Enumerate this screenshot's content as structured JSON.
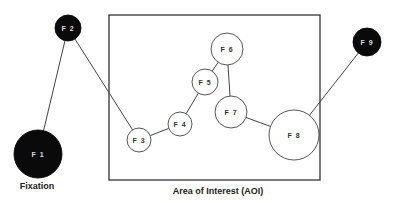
{
  "diagram": {
    "aoi_label": "Area of Interest (AOI)",
    "fixation_label": "Fixation",
    "colors": {
      "filled": "#0a0a0a",
      "outline": "#444444",
      "text_light": "#dddddd",
      "text_dark": "#333333"
    },
    "fixations": [
      {
        "id": "F1",
        "label": "F 1",
        "cx": 38,
        "cy": 154,
        "r": 24,
        "filled": true
      },
      {
        "id": "F2",
        "label": "F 2",
        "cx": 68,
        "cy": 28,
        "r": 13,
        "filled": true
      },
      {
        "id": "F3",
        "label": "F 3",
        "cx": 139,
        "cy": 140,
        "r": 12,
        "filled": false
      },
      {
        "id": "F4",
        "label": "F 4",
        "cx": 180,
        "cy": 124,
        "r": 12,
        "filled": false
      },
      {
        "id": "F5",
        "label": "F 5",
        "cx": 205,
        "cy": 82,
        "r": 13,
        "filled": false
      },
      {
        "id": "F6",
        "label": "F 6",
        "cx": 227,
        "cy": 49,
        "r": 16,
        "filled": false
      },
      {
        "id": "F7",
        "label": "F 7",
        "cx": 231,
        "cy": 112,
        "r": 16,
        "filled": false
      },
      {
        "id": "F8",
        "label": "F 8",
        "cx": 294,
        "cy": 135,
        "r": 25,
        "filled": false
      },
      {
        "id": "F9",
        "label": "F 9",
        "cx": 367,
        "cy": 42,
        "r": 14,
        "filled": true
      }
    ],
    "saccade_sequence": [
      "F1",
      "F2",
      "F3",
      "F4",
      "F5",
      "F6",
      "F7",
      "F8",
      "F9"
    ]
  }
}
